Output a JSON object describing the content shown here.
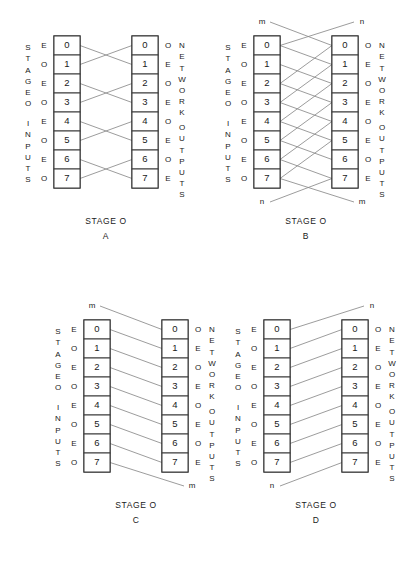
{
  "figure": {
    "background": "#ffffff",
    "line_color": "#8a8a8a",
    "box_color": "#2b2b2b",
    "cell_numbers": [
      "0",
      "1",
      "2",
      "3",
      "4",
      "5",
      "6",
      "7"
    ],
    "input_parity": [
      "E",
      "O",
      "E",
      "O",
      "E",
      "O",
      "E",
      "O"
    ],
    "output_parity": [
      "O",
      "E",
      "O",
      "E",
      "O",
      "E",
      "O",
      "E"
    ],
    "left_label_top": "STAGE O",
    "left_label_bottom": "INPUTS",
    "right_label": "NETWORK OUTPUTS",
    "left_label_top_letters": [
      "S",
      "T",
      "A",
      "G",
      "E",
      "O"
    ],
    "left_label_bottom_letters": [
      "I",
      "N",
      "P",
      "U",
      "T",
      "S"
    ],
    "right_label_top_letters": [
      "N",
      "E",
      "T",
      "W",
      "O",
      "R",
      "K"
    ],
    "right_label_bottom_letters": [
      "O",
      "U",
      "T",
      "P",
      "U",
      "T",
      "S"
    ],
    "caption_prefix": "STAGE O"
  },
  "panels": [
    {
      "id": "A",
      "caption": "STAGE O",
      "letter": "A",
      "pattern": "adjacent-pair-swap",
      "links": [
        {
          "from": 0,
          "to": 1
        },
        {
          "from": 1,
          "to": 0
        },
        {
          "from": 2,
          "to": 3
        },
        {
          "from": 3,
          "to": 2
        },
        {
          "from": 4,
          "to": 5
        },
        {
          "from": 5,
          "to": 4
        },
        {
          "from": 6,
          "to": 7
        },
        {
          "from": 7,
          "to": 6
        }
      ],
      "wrap_top": null,
      "wrap_bottom": null
    },
    {
      "id": "B",
      "caption": "STAGE O",
      "letter": "B",
      "pattern": "stride-two-butterfly-with-wrap",
      "links": [
        {
          "from": 0,
          "to": 1
        },
        {
          "from": 1,
          "to": 2
        },
        {
          "from": 2,
          "to": 3
        },
        {
          "from": 3,
          "to": 4
        },
        {
          "from": 4,
          "to": 5
        },
        {
          "from": 5,
          "to": 6
        },
        {
          "from": 6,
          "to": 7
        },
        {
          "from": 2,
          "to": 0
        },
        {
          "from": 3,
          "to": 1
        },
        {
          "from": 4,
          "to": 2
        },
        {
          "from": 5,
          "to": 3
        },
        {
          "from": 6,
          "to": 4
        },
        {
          "from": 7,
          "to": 5
        }
      ],
      "wrap_top": {
        "left_label": "m",
        "right_label": "n",
        "left_to_output": 0,
        "input_from_right": 0
      },
      "wrap_bottom": {
        "left_label": "n",
        "right_label": "m",
        "left_to_output": 7,
        "input_to_right": 7
      }
    },
    {
      "id": "C",
      "caption": "STAGE O",
      "letter": "C",
      "pattern": "shift-down-one",
      "links": [
        {
          "from": 0,
          "to": 1
        },
        {
          "from": 1,
          "to": 2
        },
        {
          "from": 2,
          "to": 3
        },
        {
          "from": 3,
          "to": 4
        },
        {
          "from": 4,
          "to": 5
        },
        {
          "from": 5,
          "to": 6
        },
        {
          "from": 6,
          "to": 7
        }
      ],
      "wrap_top": {
        "left_label": "m",
        "left_to_output": 0
      },
      "wrap_bottom": {
        "right_label": "m",
        "input_to_right": 7
      }
    },
    {
      "id": "D",
      "caption": "STAGE O",
      "letter": "D",
      "pattern": "shift-up-one",
      "links": [
        {
          "from": 1,
          "to": 0
        },
        {
          "from": 2,
          "to": 1
        },
        {
          "from": 3,
          "to": 2
        },
        {
          "from": 4,
          "to": 3
        },
        {
          "from": 5,
          "to": 4
        },
        {
          "from": 6,
          "to": 5
        },
        {
          "from": 7,
          "to": 6
        }
      ],
      "wrap_top": {
        "right_label": "n",
        "input_to_right": 0
      },
      "wrap_bottom": {
        "left_label": "n",
        "left_to_output": 7
      }
    }
  ],
  "geometry": {
    "panel_positions": [
      {
        "id": "A",
        "x": 4,
        "y": 8
      },
      {
        "id": "B",
        "x": 204,
        "y": 8
      },
      {
        "id": "C",
        "x": 34,
        "y": 292
      },
      {
        "id": "D",
        "x": 214,
        "y": 292
      }
    ],
    "panel_width": 196,
    "panel_height": 252,
    "cell_height": 19,
    "cell_width": 26,
    "in_col_x": 50,
    "out_col_x": 128,
    "col_top": 28
  }
}
